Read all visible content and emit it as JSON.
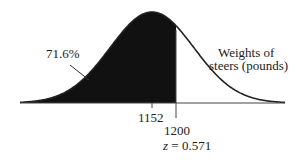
{
  "diagram": {
    "type": "normal-distribution-shaded",
    "shaded_percent_label": "71.6%",
    "variable_label_line1": "Weights of",
    "variable_label_line2": "steers (pounds)",
    "mean_label": "1152",
    "cutoff_label": "1200",
    "z_var": "z",
    "z_eq": " = 0.571",
    "colors": {
      "fill": "#111111",
      "stroke": "#222222",
      "axis": "#444444"
    }
  },
  "chart_data": {
    "type": "area",
    "title": "",
    "xlabel": "Weights of steers (pounds)",
    "mean": 1152,
    "cutoff": 1200,
    "z": 0.571,
    "shaded_region": "left of 1200",
    "shaded_percent": 71.6,
    "annotations": [
      "71.6%",
      "1152",
      "1200",
      "z = 0.571"
    ]
  }
}
